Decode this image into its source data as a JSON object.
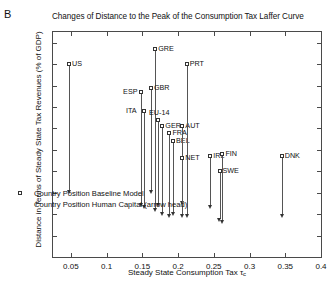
{
  "panel": {
    "letter": "B"
  },
  "chart_data": {
    "type": "scatter",
    "title": "Changes of Distance to the Peak of the Consumption Tax Laffer Curve",
    "xlabel": "Steady State Consumption Tax",
    "xlabel_symbol": "τ",
    "xlabel_subscript": "c",
    "ylabel": "Distance in Terms of Steady State Tax Revenues (% of GDP)",
    "xlim": [
      0.025,
      0.4
    ],
    "ylim": [
      0,
      105
    ],
    "xticks": [
      0.05,
      0.1,
      0.15,
      0.2,
      0.25,
      0.3,
      0.35,
      0.4
    ],
    "xtick_labels": [
      "0.05",
      "0.1",
      "0.15",
      "0.2",
      "0.25",
      "0.3",
      "0.35",
      "0.4"
    ],
    "yticks": [
      0,
      10,
      20,
      30,
      40,
      50,
      60,
      70,
      80,
      90,
      100
    ],
    "ytick_labels": [
      "0",
      "10",
      "20",
      "30",
      "40",
      "50",
      "60",
      "70",
      "80",
      "90",
      "100"
    ],
    "grid": false,
    "legend_position": "lower-left",
    "series": [
      {
        "name": "Country Position Baseline Model",
        "marker": "open-square"
      },
      {
        "name": "Country Position Human Capital (arrow head)",
        "marker": "arrow-head"
      }
    ],
    "points": [
      {
        "label": "US",
        "x": 0.0475,
        "baseline": 90,
        "human_capital": 29,
        "label_side": "right"
      },
      {
        "label": "ESP",
        "x": 0.148,
        "baseline": 77,
        "human_capital": 23,
        "label_side": "left"
      },
      {
        "label": "GRE",
        "x": 0.168,
        "baseline": 97,
        "human_capital": 21,
        "label_side": "right"
      },
      {
        "label": "GBR",
        "x": 0.162,
        "baseline": 79,
        "human_capital": 29,
        "label_side": "right"
      },
      {
        "label": "ITA",
        "x": 0.152,
        "baseline": 68,
        "human_capital": 22,
        "label_side": "left"
      },
      {
        "label": "EU-14",
        "x": 0.172,
        "baseline": 64,
        "human_capital": 23,
        "label_side": "above"
      },
      {
        "label": "GER",
        "x": 0.178,
        "baseline": 61,
        "human_capital": 19,
        "label_side": "right"
      },
      {
        "label": "FRA",
        "x": 0.188,
        "baseline": 58,
        "human_capital": 18,
        "label_side": "right"
      },
      {
        "label": "BEL",
        "x": 0.193,
        "baseline": 54,
        "human_capital": 19,
        "label_side": "right"
      },
      {
        "label": "AUT",
        "x": 0.206,
        "baseline": 61,
        "human_capital": 24,
        "label_side": "right"
      },
      {
        "label": "PRT",
        "x": 0.212,
        "baseline": 90,
        "human_capital": 18,
        "label_side": "right"
      },
      {
        "label": "NET",
        "x": 0.206,
        "baseline": 46,
        "human_capital": 18,
        "label_side": "right"
      },
      {
        "label": "IRL",
        "x": 0.245,
        "baseline": 47,
        "human_capital": 22,
        "label_side": "right"
      },
      {
        "label": "FIN",
        "x": 0.262,
        "baseline": 48,
        "human_capital": 15,
        "label_side": "right"
      },
      {
        "label": "SWE",
        "x": 0.258,
        "baseline": 40,
        "human_capital": 16,
        "label_side": "right"
      },
      {
        "label": "DNK",
        "x": 0.345,
        "baseline": 47,
        "human_capital": 18,
        "label_side": "right"
      }
    ]
  }
}
